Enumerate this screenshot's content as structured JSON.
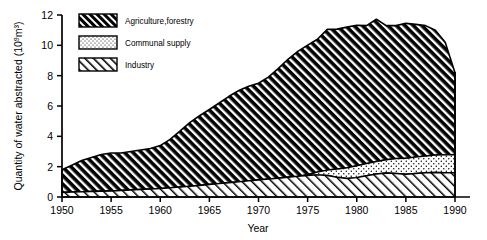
{
  "chart_data": {
    "type": "area",
    "stacked": true,
    "title": "",
    "xlabel": "Year",
    "ylabel": "Quantity of water abstracted (10⁹m³)",
    "ylabel_main": "Quantity of water abstracted (10",
    "ylabel_sup": "9",
    "ylabel_tail": "m³)",
    "xlim": [
      1950,
      1990
    ],
    "ylim": [
      0,
      12
    ],
    "grid": false,
    "xticks": [
      1950,
      1955,
      1960,
      1965,
      1970,
      1975,
      1980,
      1985,
      1990
    ],
    "yticks": [
      0,
      2,
      4,
      6,
      8,
      10,
      12
    ],
    "legend_position": "upper-left-inside",
    "x": [
      1950,
      1951,
      1952,
      1953,
      1954,
      1955,
      1956,
      1957,
      1958,
      1959,
      1960,
      1961,
      1962,
      1963,
      1964,
      1965,
      1966,
      1967,
      1968,
      1969,
      1970,
      1971,
      1972,
      1973,
      1974,
      1975,
      1976,
      1977,
      1978,
      1979,
      1980,
      1981,
      1982,
      1983,
      1984,
      1985,
      1986,
      1987,
      1988,
      1989,
      1990
    ],
    "series": [
      {
        "name": "Industry",
        "fill": "light-diagonal-hatch",
        "values": [
          0.3,
          0.32,
          0.34,
          0.36,
          0.38,
          0.4,
          0.43,
          0.46,
          0.49,
          0.52,
          0.55,
          0.6,
          0.65,
          0.7,
          0.76,
          0.82,
          0.88,
          0.94,
          1.0,
          1.06,
          1.12,
          1.18,
          1.24,
          1.3,
          1.36,
          1.42,
          1.46,
          1.42,
          1.3,
          1.22,
          1.28,
          1.4,
          1.52,
          1.58,
          1.55,
          1.5,
          1.55,
          1.6,
          1.62,
          1.6,
          1.6
        ]
      },
      {
        "name": "Communal supply",
        "fill": "dotted",
        "values": [
          0.0,
          0.0,
          0.0,
          0.0,
          0.0,
          0.0,
          0.0,
          0.0,
          0.0,
          0.0,
          0.0,
          0.0,
          0.0,
          0.0,
          0.0,
          0.0,
          0.0,
          0.0,
          0.0,
          0.0,
          0.0,
          0.0,
          0.0,
          0.0,
          0.0,
          0.05,
          0.18,
          0.35,
          0.55,
          0.7,
          0.78,
          0.8,
          0.82,
          0.88,
          0.98,
          1.05,
          1.08,
          1.1,
          1.14,
          1.18,
          1.2
        ]
      },
      {
        "name": "Agriculture,forestry",
        "fill": "dense-dark-hatch",
        "values": [
          1.5,
          1.78,
          2.06,
          2.24,
          2.42,
          2.5,
          2.47,
          2.54,
          2.61,
          2.68,
          2.84,
          3.2,
          3.7,
          4.2,
          4.6,
          4.95,
          5.32,
          5.7,
          6.02,
          6.24,
          6.38,
          6.72,
          7.22,
          7.78,
          8.24,
          8.54,
          8.76,
          9.28,
          9.22,
          9.28,
          9.26,
          9.1,
          9.38,
          8.84,
          8.77,
          8.9,
          8.75,
          8.6,
          8.24,
          7.42,
          5.4
        ]
      }
    ],
    "totals": [
      1.8,
      2.1,
      2.4,
      2.6,
      2.8,
      2.9,
      2.9,
      3.0,
      3.1,
      3.2,
      3.39,
      3.8,
      4.35,
      4.9,
      5.36,
      5.77,
      6.2,
      6.64,
      7.02,
      7.3,
      7.5,
      7.9,
      8.46,
      9.08,
      9.6,
      10.01,
      10.4,
      11.05,
      11.07,
      11.2,
      11.32,
      11.3,
      11.72,
      11.3,
      11.3,
      11.45,
      11.38,
      11.3,
      11.0,
      10.2,
      8.2
    ]
  },
  "legend": {
    "items": [
      {
        "label": "Agriculture,forestry",
        "pattern": "dense-dark-hatch"
      },
      {
        "label": "Communal supply",
        "pattern": "dotted"
      },
      {
        "label": "Industry",
        "pattern": "light-diagonal-hatch"
      }
    ]
  }
}
